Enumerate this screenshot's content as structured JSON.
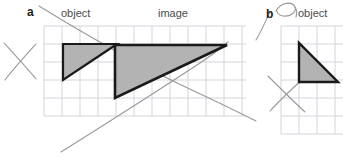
{
  "figure": {
    "type": "geometry-worksheet",
    "background_color": "#ffffff",
    "width": 343,
    "height": 157
  },
  "labels": {
    "part_a": "a",
    "part_b": "b",
    "object_left": "object",
    "image": "image",
    "object_right": "object"
  },
  "colors": {
    "grid_line": "#d3d3dd",
    "shape_fill": "#b3b3b3",
    "shape_stroke": "#1a1a1a",
    "pencil_line": "#9a9a9a",
    "text": "#4a4a4a",
    "marker_text": "#1c1c1c"
  },
  "grids": [
    {
      "name": "main-grid",
      "x": 44,
      "y": 26,
      "width": 202,
      "height": 90,
      "cell": 18,
      "cols": 11,
      "rows": 5
    },
    {
      "name": "right-grid",
      "x": 281,
      "y": 26,
      "width": 62,
      "height": 108,
      "cell": 18,
      "cols": 4,
      "rows": 6
    }
  ],
  "shapes": [
    {
      "name": "object-triangle-left",
      "role": "object",
      "points": "63,44 117,44 63,80",
      "fill": "#b3b3b3",
      "stroke": "#1a1a1a",
      "stroke_width": 2.2
    },
    {
      "name": "image-triangle",
      "role": "image",
      "points": "115,45 227,45 115,98",
      "fill": "#b3b3b3",
      "stroke": "#1a1a1a",
      "stroke_width": 2.6
    },
    {
      "name": "object-triangle-right",
      "role": "object",
      "points": "299,43 299,82 338,82",
      "fill": "#b3b3b3",
      "stroke": "#1a1a1a",
      "stroke_width": 2.4
    }
  ],
  "pencil_marks": [
    {
      "name": "ray-descending-a",
      "path": "M 39,6 C 78,30 140,66 196,92 C 222,104 244,115 256,121"
    },
    {
      "name": "ray-ascending-a",
      "path": "M 61,152 C 96,130 150,96 200,63 C 214,54 222,47 228,42"
    },
    {
      "name": "cross-mark-left-stroke1",
      "path": "M 4,43 C 14,54 26,67 36,79"
    },
    {
      "name": "cross-mark-left-stroke2",
      "path": "M 36,44 C 26,55 14,68 5,80"
    },
    {
      "name": "cross-mark-right-stroke1",
      "path": "M 268,76 C 280,88 293,101 305,112"
    },
    {
      "name": "cross-mark-right-stroke2",
      "path": "M 306,76 C 294,87 280,100 270,111"
    },
    {
      "name": "marker-b-tail",
      "path": "M 256,40 C 262,30 266,20 270,12"
    },
    {
      "name": "marker-b-loop",
      "path": "M 276,11 C 281,2 292,1 295,7 C 297,12 290,17 283,16 C 279,15 277,13 277,11"
    },
    {
      "name": "marker-b-loop-tail",
      "path": "M 295,7 C 297,10 297,14 296,17"
    }
  ]
}
